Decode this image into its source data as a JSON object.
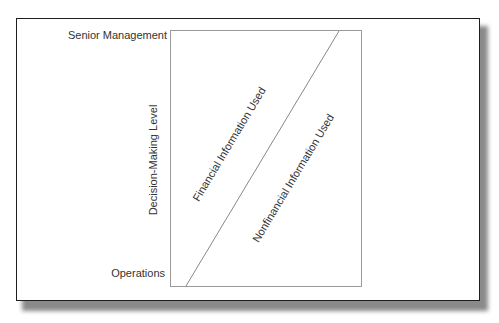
{
  "diagram": {
    "y_axis_label": "Decision-Making Level",
    "y_top_label": "Senior Management",
    "y_bottom_label": "Operations",
    "region_upper_left_label": "Financial Information Used",
    "region_lower_right_label": "Nonfinancial Information Used",
    "colors": {
      "frame_border": "#1e1e1e",
      "plot_border": "#9a9a9a",
      "divider_line": "#7a7a7a",
      "text": "#333333",
      "shadow": "#8a8a8a"
    }
  }
}
